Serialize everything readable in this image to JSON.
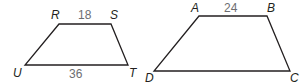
{
  "figures": [
    {
      "name": "RSTU",
      "vertices": {
        "R": [
          59,
          24
        ],
        "S": [
          111,
          24
        ],
        "T": [
          128,
          65
        ],
        "U": [
          25,
          65
        ]
      },
      "labels": {
        "R": "R",
        "S": "S",
        "T": "T",
        "U": "U"
      },
      "sides": {
        "RS": "18",
        "UT": "36"
      }
    },
    {
      "name": "ABCD",
      "vertices": {
        "A": [
          199,
          16
        ],
        "B": [
          267,
          16
        ],
        "C": [
          290,
          71
        ],
        "D": [
          154,
          71
        ]
      },
      "labels": {
        "A": "A",
        "B": "B",
        "C": "C",
        "D": "D"
      },
      "sides": {
        "AB": "24"
      }
    }
  ],
  "colors": {
    "stroke": "#231f20",
    "side_label": "#6d6e71"
  }
}
